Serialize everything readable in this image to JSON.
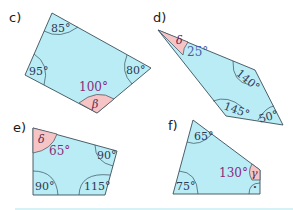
{
  "colors": {
    "shape_fill": "#b9ecf5",
    "unknown_fill": "#f6c4c4",
    "outline": "#3a4f5a",
    "highlight_text": "#8a2d7a",
    "footer_line": "#c8eef4"
  },
  "figures": [
    {
      "label": "c)",
      "angles": {
        "top": "85°",
        "left": "95°",
        "right": "80°",
        "bottom_given": "100°",
        "bottom_unknown": "β"
      }
    },
    {
      "label": "d)",
      "angles": {
        "tip_unknown": "δ",
        "tip_given": "25°",
        "upper_right": "140°",
        "lower_left": "145°",
        "right": "50°"
      }
    },
    {
      "label": "e)",
      "angles": {
        "top_left_unknown": "δ",
        "top_left_given": "65°",
        "top_right": "90°",
        "bottom_left": "90°",
        "bottom_right": "115°"
      }
    },
    {
      "label": "f)",
      "angles": {
        "top": "65°",
        "bottom_left": "75°",
        "right_given": "130°",
        "right_unknown": "γ",
        "right_angle_mark": "·"
      }
    }
  ]
}
